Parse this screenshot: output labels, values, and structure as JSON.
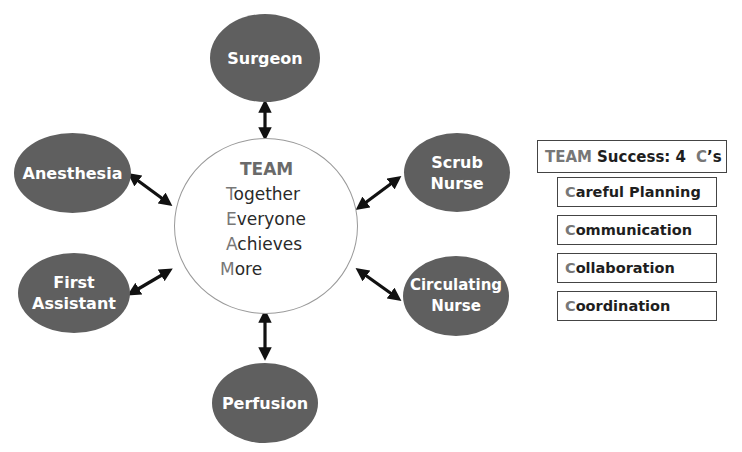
{
  "diagram": {
    "type": "hub-and-spoke",
    "hub": {
      "title": "TEAM",
      "lines": [
        {
          "initial": "T",
          "rest": "ogether"
        },
        {
          "initial": "E",
          "rest": "veryone"
        },
        {
          "initial": "A",
          "rest": "chieves"
        },
        {
          "initial": "M",
          "rest": "ore"
        }
      ]
    },
    "roles": [
      {
        "id": "surgeon",
        "lines": [
          "Surgeon"
        ]
      },
      {
        "id": "anesthesia",
        "lines": [
          "Anesthesia"
        ]
      },
      {
        "id": "first-assistant",
        "lines": [
          "First",
          "Assistant"
        ]
      },
      {
        "id": "scrub-nurse",
        "lines": [
          "Scrub",
          "Nurse"
        ]
      },
      {
        "id": "circulating-nurse",
        "lines": [
          "Circulating",
          "Nurse"
        ]
      },
      {
        "id": "perfusion",
        "lines": [
          "Perfusion"
        ]
      }
    ],
    "connections": "bidirectional arrows between hub and each role",
    "colors": {
      "role_fill": "#5f5f5f",
      "role_text": "#ffffff",
      "hub_border": "#9a9a9a",
      "accent_letters": "#777777",
      "arrow": "#111111"
    }
  },
  "success_panel": {
    "title_team": "TEAM",
    "title_rest": "Success: 4",
    "title_c": "C",
    "title_suffix": "’s",
    "items": [
      {
        "initial": "C",
        "rest": "areful Planning"
      },
      {
        "initial": "C",
        "rest": "ommunication"
      },
      {
        "initial": "C",
        "rest": "ollaboration"
      },
      {
        "initial": "C",
        "rest": "oordination"
      }
    ]
  }
}
